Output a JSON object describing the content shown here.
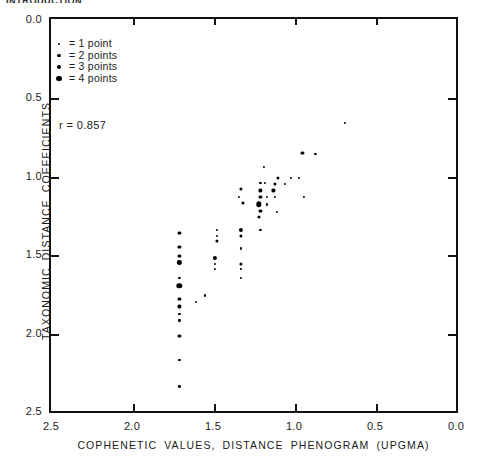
{
  "figure": {
    "cut_off_header": "INTRODUCTION",
    "r_label": "r = 0.857"
  },
  "legend": {
    "entries": [
      {
        "label": "= 1 point",
        "size": 2.2,
        "count": 1
      },
      {
        "label": "= 2 points",
        "size": 3.2,
        "count": 2
      },
      {
        "label": "= 3 points",
        "size": 4.2,
        "count": 3
      },
      {
        "label": "= 4 points",
        "size": 5.4,
        "count": 4
      }
    ]
  },
  "chart_data": {
    "type": "scatter",
    "title": "",
    "xlabel": "COPHENETIC VALUES, DISTANCE PHENOGRAM   (UPGMA)",
    "ylabel": "TAXONOMIC DISTANCE COEFFICIENTS",
    "xlim": [
      2.5,
      0.0
    ],
    "ylim": [
      2.5,
      0.0
    ],
    "x_reversed": true,
    "y_reversed": true,
    "xticks": [
      2.5,
      2.0,
      1.5,
      1.0,
      0.5,
      0.0
    ],
    "xticklabels": [
      "2.5",
      "2.0",
      "1.5",
      "1.0",
      "0.5",
      "0.0"
    ],
    "yticks": [
      0.0,
      0.5,
      1.0,
      1.5,
      2.0,
      2.5
    ],
    "yticklabels": [
      "0.0",
      "0.5",
      "1.0",
      "1.5",
      "2.0",
      "2.5"
    ],
    "grid": false,
    "legend_position": "upper-left",
    "correlation_r": 0.857,
    "annotations": [
      "r = 0.857"
    ],
    "size_encoding": "marker area encodes number of coincident points (1-4)",
    "points": [
      {
        "x": 0.7,
        "y": 0.65,
        "n": 1
      },
      {
        "x": 0.96,
        "y": 0.84,
        "n": 2
      },
      {
        "x": 0.88,
        "y": 0.85,
        "n": 1
      },
      {
        "x": 1.2,
        "y": 0.93,
        "n": 1
      },
      {
        "x": 1.11,
        "y": 1.0,
        "n": 2
      },
      {
        "x": 1.03,
        "y": 1.0,
        "n": 1
      },
      {
        "x": 0.98,
        "y": 1.0,
        "n": 1
      },
      {
        "x": 1.22,
        "y": 1.03,
        "n": 1
      },
      {
        "x": 1.19,
        "y": 1.03,
        "n": 1
      },
      {
        "x": 1.13,
        "y": 1.04,
        "n": 2
      },
      {
        "x": 1.07,
        "y": 1.04,
        "n": 1
      },
      {
        "x": 1.34,
        "y": 1.07,
        "n": 2
      },
      {
        "x": 1.22,
        "y": 1.08,
        "n": 2
      },
      {
        "x": 1.14,
        "y": 1.08,
        "n": 2
      },
      {
        "x": 1.35,
        "y": 1.12,
        "n": 1
      },
      {
        "x": 1.22,
        "y": 1.12,
        "n": 2
      },
      {
        "x": 1.18,
        "y": 1.12,
        "n": 1
      },
      {
        "x": 1.13,
        "y": 1.12,
        "n": 1
      },
      {
        "x": 0.95,
        "y": 1.12,
        "n": 1
      },
      {
        "x": 1.33,
        "y": 1.16,
        "n": 2
      },
      {
        "x": 1.23,
        "y": 1.17,
        "n": 4
      },
      {
        "x": 1.18,
        "y": 1.17,
        "n": 1
      },
      {
        "x": 1.22,
        "y": 1.21,
        "n": 2
      },
      {
        "x": 1.12,
        "y": 1.22,
        "n": 1
      },
      {
        "x": 1.23,
        "y": 1.25,
        "n": 2
      },
      {
        "x": 1.49,
        "y": 1.33,
        "n": 1
      },
      {
        "x": 1.34,
        "y": 1.33,
        "n": 3
      },
      {
        "x": 1.22,
        "y": 1.33,
        "n": 1
      },
      {
        "x": 1.72,
        "y": 1.35,
        "n": 2
      },
      {
        "x": 1.49,
        "y": 1.37,
        "n": 1
      },
      {
        "x": 1.34,
        "y": 1.37,
        "n": 2
      },
      {
        "x": 1.49,
        "y": 1.4,
        "n": 2
      },
      {
        "x": 1.72,
        "y": 1.44,
        "n": 2
      },
      {
        "x": 1.34,
        "y": 1.45,
        "n": 1
      },
      {
        "x": 1.72,
        "y": 1.5,
        "n": 2
      },
      {
        "x": 1.5,
        "y": 1.51,
        "n": 3
      },
      {
        "x": 1.72,
        "y": 1.54,
        "n": 3
      },
      {
        "x": 1.5,
        "y": 1.55,
        "n": 1
      },
      {
        "x": 1.34,
        "y": 1.55,
        "n": 2
      },
      {
        "x": 1.5,
        "y": 1.58,
        "n": 1
      },
      {
        "x": 1.34,
        "y": 1.58,
        "n": 1
      },
      {
        "x": 1.72,
        "y": 1.64,
        "n": 1
      },
      {
        "x": 1.34,
        "y": 1.64,
        "n": 1
      },
      {
        "x": 1.72,
        "y": 1.69,
        "n": 4
      },
      {
        "x": 1.56,
        "y": 1.75,
        "n": 1
      },
      {
        "x": 1.72,
        "y": 1.77,
        "n": 2
      },
      {
        "x": 1.62,
        "y": 1.79,
        "n": 1
      },
      {
        "x": 1.72,
        "y": 1.82,
        "n": 2
      },
      {
        "x": 1.72,
        "y": 1.87,
        "n": 1
      },
      {
        "x": 1.72,
        "y": 1.91,
        "n": 1
      },
      {
        "x": 1.72,
        "y": 2.01,
        "n": 2
      },
      {
        "x": 1.72,
        "y": 2.16,
        "n": 1
      },
      {
        "x": 1.72,
        "y": 2.33,
        "n": 1
      }
    ]
  }
}
